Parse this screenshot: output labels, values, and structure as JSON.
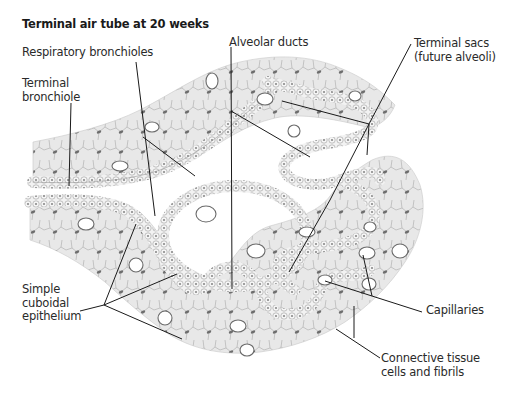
{
  "figure": {
    "title": "Terminal air tube at 20 weeks",
    "colors": {
      "tissue_fill": "#e6e6e6",
      "tissue_stroke": "#9a9a9a",
      "epithelium_fill": "#f2f2f2",
      "cell_nucleus": "#7a7a7a",
      "capillary_fill": "#ffffff",
      "leader_line": "#1a1a1a",
      "label_text": "#2a2a2a"
    }
  },
  "labels": [
    {
      "id": "respiratory-bronchioles",
      "text": "Respiratory bronchioles",
      "x": 22,
      "y": 46
    },
    {
      "id": "terminal-bronchiole",
      "text": "Terminal\nbronchiole",
      "x": 22,
      "y": 77
    },
    {
      "id": "alveolar-ducts",
      "text": "Alveolar ducts",
      "x": 229,
      "y": 36
    },
    {
      "id": "terminal-sacs",
      "text": "Terminal sacs\n(future alveoli)",
      "x": 414,
      "y": 37
    },
    {
      "id": "simple-cuboidal-epithelium",
      "text": "Simple\ncuboidal\nepithelium",
      "x": 22,
      "y": 283
    },
    {
      "id": "capillaries",
      "text": "Capillaries",
      "x": 426,
      "y": 304
    },
    {
      "id": "connective-tissue",
      "text": "Connective tissue\ncells and fibrils",
      "x": 381,
      "y": 352
    }
  ]
}
